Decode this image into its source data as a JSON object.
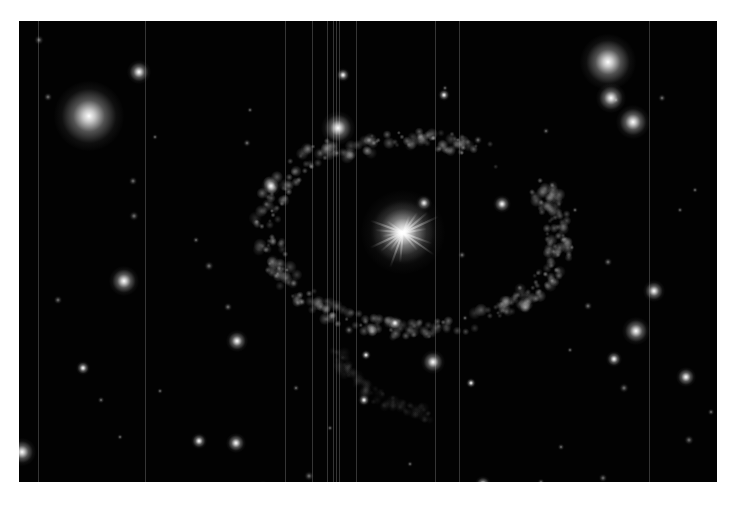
{
  "image": {
    "subject": "supernova remnant / nebula shell around a central star",
    "background_color": "#020202",
    "border_color": "#ffffff",
    "frame": {
      "x": 19,
      "y": 21,
      "width": 698,
      "height": 461
    },
    "central_star": {
      "x": 403,
      "y": 232,
      "size": 60
    },
    "bright_stars": [
      {
        "x": 89,
        "y": 116,
        "size": 70
      },
      {
        "x": 608,
        "y": 62,
        "size": 56
      },
      {
        "x": 611,
        "y": 98,
        "size": 30
      },
      {
        "x": 633,
        "y": 122,
        "size": 34
      },
      {
        "x": 338,
        "y": 128,
        "size": 34
      },
      {
        "x": 139,
        "y": 72,
        "size": 24
      },
      {
        "x": 124,
        "y": 281,
        "size": 30
      },
      {
        "x": 636,
        "y": 331,
        "size": 28
      },
      {
        "x": 654,
        "y": 291,
        "size": 22
      },
      {
        "x": 237,
        "y": 341,
        "size": 22
      },
      {
        "x": 433,
        "y": 362,
        "size": 24
      },
      {
        "x": 22,
        "y": 452,
        "size": 28
      },
      {
        "x": 236,
        "y": 443,
        "size": 20
      },
      {
        "x": 199,
        "y": 441,
        "size": 16
      },
      {
        "x": 263,
        "y": 490,
        "size": 18
      },
      {
        "x": 422,
        "y": 500,
        "size": 20
      },
      {
        "x": 483,
        "y": 484,
        "size": 16
      },
      {
        "x": 686,
        "y": 377,
        "size": 20
      },
      {
        "x": 271,
        "y": 186,
        "size": 20
      },
      {
        "x": 502,
        "y": 204,
        "size": 18
      },
      {
        "x": 424,
        "y": 203,
        "size": 16
      },
      {
        "x": 395,
        "y": 323,
        "size": 14
      },
      {
        "x": 614,
        "y": 359,
        "size": 16
      },
      {
        "x": 83,
        "y": 368,
        "size": 14
      },
      {
        "x": 343,
        "y": 75,
        "size": 14
      },
      {
        "x": 444,
        "y": 95,
        "size": 12
      },
      {
        "x": 364,
        "y": 400,
        "size": 12
      },
      {
        "x": 366,
        "y": 355,
        "size": 10
      },
      {
        "x": 471,
        "y": 383,
        "size": 10
      }
    ],
    "faint_stars": [
      [
        39,
        40
      ],
      [
        48,
        97
      ],
      [
        155,
        137
      ],
      [
        247,
        143
      ],
      [
        133,
        181
      ],
      [
        58,
        300
      ],
      [
        101,
        400
      ],
      [
        134,
        216
      ],
      [
        209,
        266
      ],
      [
        228,
        307
      ],
      [
        160,
        391
      ],
      [
        120,
        437
      ],
      [
        309,
        476
      ],
      [
        330,
        428
      ],
      [
        478,
        140
      ],
      [
        445,
        88
      ],
      [
        546,
        131
      ],
      [
        575,
        210
      ],
      [
        608,
        262
      ],
      [
        680,
        210
      ],
      [
        695,
        190
      ],
      [
        588,
        306
      ],
      [
        570,
        350
      ],
      [
        624,
        388
      ],
      [
        711,
        412
      ],
      [
        700,
        498
      ],
      [
        541,
        482
      ],
      [
        561,
        447
      ],
      [
        603,
        478
      ],
      [
        465,
        318
      ],
      [
        470,
        500
      ],
      [
        410,
        464
      ],
      [
        462,
        255
      ],
      [
        349,
        330
      ],
      [
        296,
        388
      ],
      [
        196,
        240
      ],
      [
        250,
        110
      ],
      [
        662,
        98
      ],
      [
        616,
        100
      ],
      [
        689,
        440
      ]
    ],
    "streak_x": [
      38,
      145,
      285,
      312,
      327,
      333,
      336,
      339,
      356,
      435,
      459,
      649
    ],
    "shell_description": "clumpy, filamentary ring ~290px wide centered near (415,235)"
  }
}
